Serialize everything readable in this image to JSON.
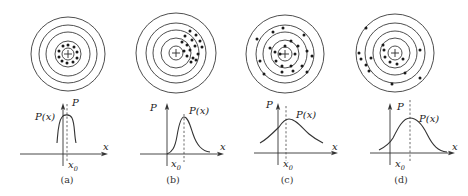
{
  "figure": {
    "panels": [
      {
        "id": "a",
        "caption": "(a)",
        "target": {
          "cx": 68,
          "cy": 54,
          "radii": [
            37,
            29,
            22,
            13,
            6
          ],
          "dots": [
            [
              0,
              -9
            ],
            [
              6,
              -7
            ],
            [
              9,
              -2
            ],
            [
              9,
              4
            ],
            [
              5,
              8
            ],
            [
              -1,
              9
            ],
            [
              -6,
              7
            ],
            [
              -9,
              3
            ],
            [
              -9,
              -3
            ],
            [
              -5,
              -8
            ]
          ]
        },
        "plot": {
          "y_axis_x": 63,
          "y_axis_top": 103,
          "x_axis_y": 154,
          "x_axis_left": 20,
          "x_axis_right": 108,
          "x0": 67,
          "dash_top": 104,
          "curve": "M57,143 C58,132 58,122 62,117 C64,114 70,114 72,118 C75,124 74,134 76,143",
          "label_P": {
            "text": "P",
            "x": 72,
            "y": 106
          },
          "label_Px": {
            "text": "P(x)",
            "x": 35,
            "y": 120
          },
          "label_x": {
            "text": "x",
            "x": 103,
            "y": 150
          },
          "label_x0": {
            "text": "x",
            "sub": "0",
            "x": 68,
            "y": 168
          }
        },
        "caption_pos": {
          "x": 67,
          "y": 183
        }
      },
      {
        "id": "b",
        "caption": "(b)",
        "target": {
          "cx": 176,
          "cy": 53,
          "radii": [
            40,
            30,
            23,
            15,
            7
          ],
          "dots": [
            [
              14,
              -22
            ],
            [
              20,
              -18
            ],
            [
              9,
              -17
            ],
            [
              16,
              -13
            ],
            [
              24,
              -12
            ],
            [
              6,
              -11
            ],
            [
              11,
              -8
            ],
            [
              19,
              -7
            ],
            [
              26,
              -6
            ],
            [
              8,
              -2
            ],
            [
              14,
              -3
            ],
            [
              22,
              1
            ],
            [
              11,
              3
            ],
            [
              17,
              5
            ],
            [
              20,
              7
            ],
            [
              15,
              9
            ]
          ]
        },
        "plot": {
          "y_axis_x": 167,
          "y_axis_top": 103,
          "x_axis_y": 154,
          "x_axis_left": 140,
          "x_axis_right": 224,
          "x0": 184,
          "dash_top": 114,
          "curve": "M167,154 C172,152 175,148 177,136 C179,124 181,117 184,117 C188,117 190,125 193,134 C197,146 202,151 210,152",
          "label_P": {
            "text": "P",
            "x": 150,
            "y": 111
          },
          "label_Px": {
            "text": "P(x)",
            "x": 189,
            "y": 114
          },
          "label_x": {
            "text": "x",
            "x": 220,
            "y": 150
          },
          "label_x0": {
            "text": "x",
            "sub": "0",
            "x": 171,
            "y": 167
          }
        },
        "caption_pos": {
          "x": 173,
          "y": 183
        }
      },
      {
        "id": "c",
        "caption": "(c)",
        "target": {
          "cx": 285,
          "cy": 54,
          "radii": [
            39,
            29,
            22,
            14,
            7
          ],
          "dots": [
            [
              -2,
              -26
            ],
            [
              -12,
              -22
            ],
            [
              19,
              -19
            ],
            [
              -28,
              -15
            ],
            [
              6,
              -13
            ],
            [
              -15,
              -6
            ],
            [
              -10,
              -2
            ],
            [
              0,
              -8
            ],
            [
              13,
              -8
            ],
            [
              22,
              -3
            ],
            [
              -5,
              0
            ],
            [
              10,
              0
            ],
            [
              27,
              2
            ],
            [
              -25,
              7
            ],
            [
              -9,
              7
            ],
            [
              -3,
              12
            ],
            [
              6,
              12
            ],
            [
              17,
              12
            ],
            [
              -3,
              18
            ],
            [
              8,
              17
            ],
            [
              -21,
              20
            ],
            [
              22,
              18
            ]
          ]
        },
        "plot": {
          "y_axis_x": 278,
          "y_axis_top": 103,
          "x_axis_y": 153,
          "x_axis_left": 254,
          "x_axis_right": 338,
          "x0": 286,
          "dash_top": 106,
          "curve": "M260,143 C266,140 272,134 279,127 C283,121 286,119 289,119 C296,119 302,128 309,134 C315,139 319,141 323,143",
          "label_P": {
            "text": "P",
            "x": 266,
            "y": 108
          },
          "label_Px": {
            "text": "P(x)",
            "x": 296,
            "y": 118
          },
          "label_x": {
            "text": "x",
            "x": 332,
            "y": 150
          },
          "label_x0": {
            "text": "x",
            "sub": "0",
            "x": 283,
            "y": 167
          }
        },
        "caption_pos": {
          "x": 287,
          "y": 183
        }
      },
      {
        "id": "d",
        "caption": "(d)",
        "target": {
          "cx": 395,
          "cy": 53,
          "radii": [
            39,
            30,
            22,
            15,
            7
          ],
          "dots": [
            [
              -29,
              -25
            ],
            [
              -36,
              0
            ],
            [
              -34,
              6
            ],
            [
              -29,
              12
            ],
            [
              -26,
              18
            ],
            [
              -11,
              -3
            ],
            [
              -10,
              4
            ],
            [
              -24,
              5
            ],
            [
              -5,
              9
            ],
            [
              8,
              6
            ],
            [
              2,
              11
            ],
            [
              25,
              -3
            ],
            [
              10,
              20
            ],
            [
              25,
              25
            ],
            [
              -3,
              31
            ],
            [
              -12,
              -8
            ]
          ]
        },
        "plot": {
          "y_axis_x": 390,
          "y_axis_top": 103,
          "x_axis_y": 153,
          "x_axis_left": 370,
          "x_axis_right": 455,
          "x0": 410,
          "dash_top": 100,
          "curve": "M379,150 C385,147 390,143 393,138 C398,128 403,118 410,118 C418,118 423,126 427,134 C433,146 438,151 447,152",
          "label_P": {
            "text": "P",
            "x": 397,
            "y": 110
          },
          "label_Px": {
            "text": "P(x)",
            "x": 419,
            "y": 122
          },
          "label_x": {
            "text": "x",
            "x": 452,
            "y": 150
          },
          "label_x0": {
            "text": "x",
            "sub": "0",
            "x": 395,
            "y": 167
          }
        },
        "caption_pos": {
          "x": 401,
          "y": 183
        }
      }
    ]
  }
}
